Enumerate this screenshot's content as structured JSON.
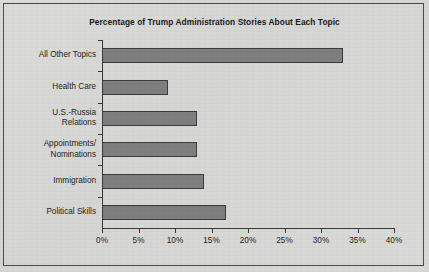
{
  "chart_data": {
    "type": "bar",
    "orientation": "horizontal",
    "title": "Percentage of Trump Administration Stories About Each Topic",
    "xlabel": "",
    "ylabel": "",
    "categories": [
      "All Other Topics",
      "Health Care",
      "U.S.-Russia\nRelations",
      "Appointments/\nNominations",
      "Immigration",
      "Political Skills"
    ],
    "values": [
      33,
      9,
      13,
      13,
      14,
      17
    ],
    "xlim": [
      0,
      40
    ],
    "xticks": [
      0,
      5,
      10,
      15,
      20,
      25,
      30,
      35,
      40
    ],
    "xtick_labels": [
      "0%",
      "5%",
      "10%",
      "15%",
      "20%",
      "25%",
      "30%",
      "35%",
      "40%"
    ],
    "grid": false,
    "legend": false,
    "bar_color": "#7f7f7f",
    "bar_edge_color": "#3c3c3c",
    "background_color": "#d8d8d6",
    "axis_color": "#3a3a3a",
    "text_color": "#242424"
  }
}
